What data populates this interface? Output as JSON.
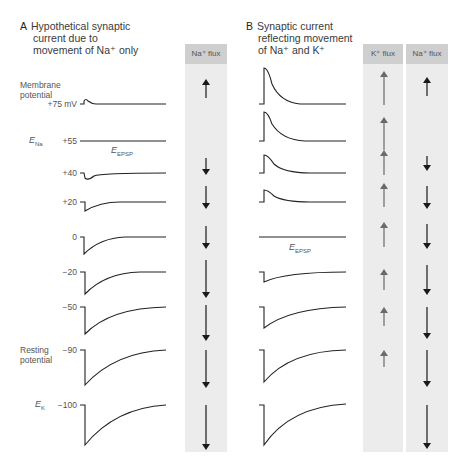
{
  "panel_a": {
    "letter": "A",
    "title_lines": [
      "Hypothetical synaptic",
      "current due to",
      "movement of Na⁺ only"
    ],
    "flux_header": "Na⁺ flux",
    "y_axis_caption": [
      "Membrane",
      "potential"
    ],
    "resting_caption": [
      "Resting",
      "potential"
    ],
    "e_na_label": "E",
    "e_na_sub": "Na",
    "e_k_label": "E",
    "e_k_sub": "K",
    "e_epsp_label": "E",
    "e_epsp_sub": "EPSP",
    "rows": [
      {
        "potential": "+75 mV",
        "current": "outward-small",
        "na_flux": "up-short"
      },
      {
        "potential": "+55",
        "current": "none",
        "na_flux": "none"
      },
      {
        "potential": "+40",
        "current": "inward-small",
        "na_flux": "down-short"
      },
      {
        "potential": "+20",
        "current": "inward",
        "na_flux": "down-medium"
      },
      {
        "potential": "0",
        "current": "inward",
        "na_flux": "down-medium"
      },
      {
        "potential": "−20",
        "current": "inward-larger",
        "na_flux": "down-long"
      },
      {
        "potential": "−50",
        "current": "inward-larger",
        "na_flux": "down-long"
      },
      {
        "potential": "−90",
        "current": "inward-large",
        "na_flux": "down-long"
      },
      {
        "potential": "−100",
        "current": "inward-large",
        "na_flux": "down-long"
      }
    ]
  },
  "panel_b": {
    "letter": "B",
    "title_lines": [
      "Synaptic current",
      "reflecting movement",
      "of Na⁺ and K⁺"
    ],
    "k_flux_header": "K⁺ flux",
    "na_flux_header": "Na⁺ flux",
    "e_epsp_label": "E",
    "e_epsp_sub": "EPSP",
    "rows": [
      {
        "potential": "+75 mV",
        "current": "outward-large",
        "k_flux": "up-long",
        "na_flux": "up-short"
      },
      {
        "potential": "+55",
        "current": "outward",
        "k_flux": "up-long",
        "na_flux": "none"
      },
      {
        "potential": "+40",
        "current": "outward-small",
        "k_flux": "up-medium",
        "na_flux": "down-short"
      },
      {
        "potential": "+20",
        "current": "outward-small",
        "k_flux": "up-medium",
        "na_flux": "down-medium"
      },
      {
        "potential": "0",
        "current": "none",
        "k_flux": "up-medium",
        "na_flux": "down-medium"
      },
      {
        "potential": "−20",
        "current": "inward-small",
        "k_flux": "up-short",
        "na_flux": "down-long"
      },
      {
        "potential": "−50",
        "current": "inward",
        "k_flux": "up-short",
        "na_flux": "down-long"
      },
      {
        "potential": "−90",
        "current": "inward-large",
        "k_flux": "up-short",
        "na_flux": "down-long"
      },
      {
        "potential": "−100",
        "current": "inward-large",
        "k_flux": "none",
        "na_flux": "down-long"
      }
    ]
  },
  "colors": {
    "flux_column_bg": "#ececec",
    "flux_header_bg": "#cfcfcf",
    "trace": "#222222",
    "na_arrow": "#1a1a1a",
    "k_arrow": "#6a6a6a"
  }
}
